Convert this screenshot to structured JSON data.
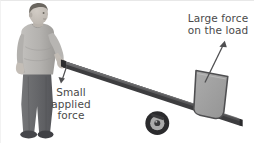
{
  "figure": {
    "background_color": "#ffffff",
    "width": 254,
    "height": 143
  },
  "labels": {
    "large_force": {
      "text": "Large force\non the load",
      "lines": [
        "Large force",
        "on the load"
      ],
      "color": "#4a4a4a"
    },
    "small_force": {
      "text": "Small\napplied\nforce",
      "lines": [
        "Small",
        "applied",
        "force"
      ],
      "color": "#4a4a4a"
    }
  },
  "scene": {
    "person": {
      "name": "man-pushing-lever",
      "skin_color": "#c9c3bd",
      "shirt_color": "#b6b4b1",
      "shirt_shadow": "#9d9b98",
      "trousers_color": "#6f7072",
      "trousers_shadow": "#5b5c5e",
      "shoes_color": "#4a4b4d",
      "hair_color": "#6a665f"
    },
    "lever": {
      "name": "lever-bar",
      "top_color": "#58585a",
      "side_color": "#3b3b3d",
      "edge_color": "#2e2e30"
    },
    "wheel": {
      "name": "fulcrum-wheel",
      "tire_color": "#2b2b2d",
      "rim_color": "#a8a8a8",
      "hub_color": "#3a3a3c"
    },
    "load": {
      "name": "load-block",
      "fill_color": "#a3a3a3",
      "stroke_color": "#4f4f51"
    },
    "arrows": {
      "large_force_arrow": {
        "name": "large-force-arrow",
        "color": "#4f4f51",
        "direction": "up-right"
      },
      "small_force_arrow": {
        "name": "small-force-arrow",
        "color": "#4f4f51",
        "direction": "down-left"
      }
    }
  }
}
